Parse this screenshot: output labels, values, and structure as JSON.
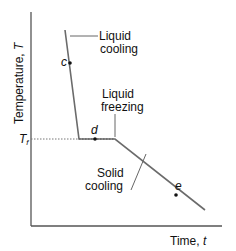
{
  "diagram": {
    "type": "cooling-curve",
    "axes": {
      "y_label": "Temperature,",
      "y_symbol": "T",
      "x_label": "Time,",
      "x_symbol": "t",
      "tf_label": "T",
      "tf_subscript": "f"
    },
    "regions": {
      "liquid_cooling": [
        "Liquid",
        "cooling"
      ],
      "liquid_freezing": [
        "Liquid",
        "freezing"
      ],
      "solid_cooling": [
        "Solid",
        "cooling"
      ]
    },
    "points": {
      "c": "c",
      "d": "d",
      "e": "e"
    },
    "colors": {
      "curve": "#6b6b6b",
      "axis": "#555555",
      "text": "#111111",
      "dotted": "#777777"
    }
  }
}
